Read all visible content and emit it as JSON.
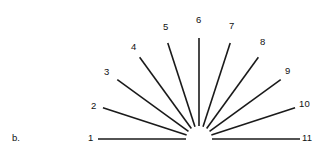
{
  "figure": {
    "caption": "b.",
    "background_color": "#ffffff",
    "line_color": "#1a1a1a",
    "label_color": "#111111",
    "center": {
      "x": 199,
      "y": 139
    },
    "inner_radius": 13,
    "outer_radius": 101,
    "stroke_width": 1.6,
    "angle_step_degrees": 18,
    "spoke_count": 11
  },
  "chart_data": {
    "type": "scatter",
    "title": "",
    "subtitle": "",
    "xlabel": "",
    "ylabel": "",
    "grid": false,
    "legend_position": "none",
    "annotations": [
      "b."
    ],
    "categories": [
      "1",
      "2",
      "3",
      "4",
      "5",
      "6",
      "7",
      "8",
      "9",
      "10",
      "11"
    ],
    "values": [
      180,
      162,
      144,
      126,
      108,
      90,
      72,
      54,
      36,
      18,
      0
    ],
    "series": [
      {
        "name": "spoke angle (degrees from positive x-axis, counterclockwise)",
        "values": [
          180,
          162,
          144,
          126,
          108,
          90,
          72,
          54,
          36,
          18,
          0
        ]
      },
      {
        "name": "spoke radius (px)",
        "values": [
          101,
          101,
          101,
          101,
          101,
          101,
          101,
          101,
          101,
          101,
          101
        ]
      }
    ],
    "xlim": [
      -101,
      101
    ],
    "ylim": [
      0,
      101
    ]
  },
  "spokes": [
    {
      "id": "1",
      "label": "1",
      "angle": 180,
      "label_x": 88,
      "label_y": 133
    },
    {
      "id": "2",
      "label": "2",
      "angle": 162,
      "label_x": 91,
      "label_y": 101
    },
    {
      "id": "3",
      "label": "3",
      "angle": 144,
      "label_x": 104,
      "label_y": 67
    },
    {
      "id": "4",
      "label": "4",
      "angle": 126,
      "label_x": 131,
      "label_y": 42
    },
    {
      "id": "5",
      "label": "5",
      "angle": 108,
      "label_x": 163,
      "label_y": 22
    },
    {
      "id": "6",
      "label": "6",
      "angle": 90,
      "label_x": 196,
      "label_y": 15
    },
    {
      "id": "7",
      "label": "7",
      "angle": 72,
      "label_x": 229,
      "label_y": 21
    },
    {
      "id": "8",
      "label": "8",
      "angle": 54,
      "label_x": 260,
      "label_y": 37
    },
    {
      "id": "9",
      "label": "9",
      "angle": 36,
      "label_x": 285,
      "label_y": 66
    },
    {
      "id": "10",
      "label": "10",
      "angle": 18,
      "label_x": 299,
      "label_y": 99
    },
    {
      "id": "11",
      "label": "11",
      "angle": 0,
      "label_x": 302,
      "label_y": 133
    }
  ]
}
